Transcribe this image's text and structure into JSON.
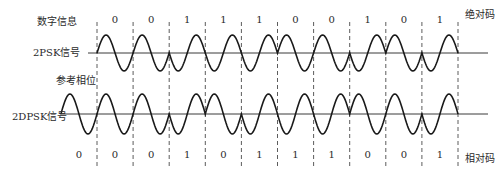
{
  "labels": {
    "digital_info": "数字信息",
    "psk": "2PSK信号",
    "reference_phase": "参考相位",
    "dpsk": "2DPSK信号",
    "absolute_code": "绝对码",
    "relative_code": "相对码"
  },
  "absolute_code": [
    "0",
    "0",
    "1",
    "1",
    "1",
    "0",
    "0",
    "1",
    "0",
    "1"
  ],
  "relative_code": {
    "reference": "0",
    "bits": [
      "0",
      "0",
      "1",
      "0",
      "1",
      "1",
      "1",
      "0",
      "0",
      "1"
    ]
  },
  "signals": {
    "psk": {
      "phase_rule": "bit 0 → 0 phase, bit 1 → π phase",
      "source": "absolute_code"
    },
    "dpsk": {
      "phase_rule": "relative bit 0 → 0 phase, relative bit 1 → π phase",
      "source": "relative_code"
    }
  },
  "colors": {
    "waveform": "#1a1a1a",
    "axis": "#3a3a3a",
    "dashed": "#4a4a4a"
  }
}
